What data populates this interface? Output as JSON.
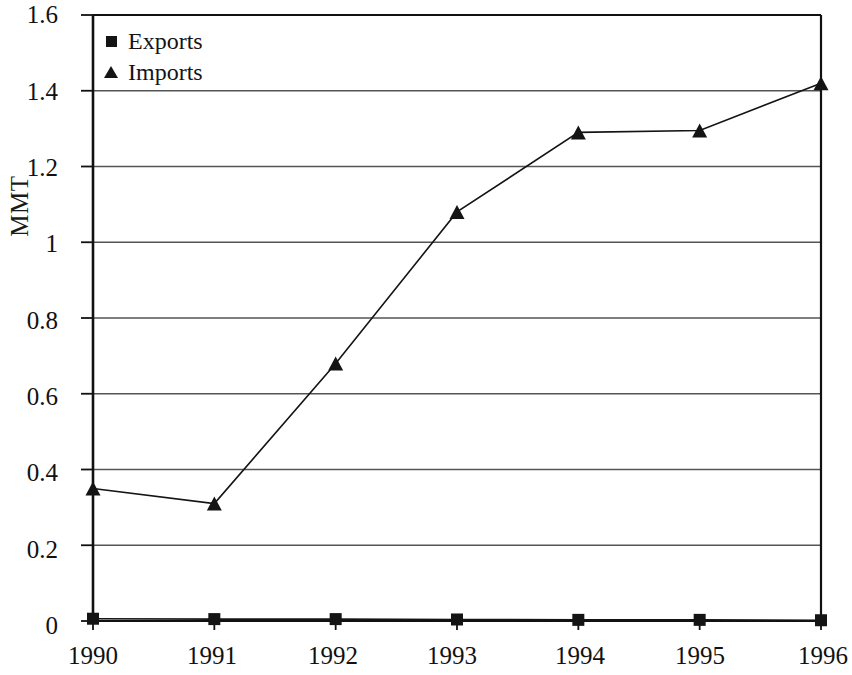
{
  "chart_data": {
    "type": "line",
    "title": "",
    "xlabel": "",
    "ylabel": "MMT",
    "categories": [
      "1990",
      "1991",
      "1992",
      "1993",
      "1994",
      "1995",
      "1996"
    ],
    "series": [
      {
        "name": "Exports",
        "marker": "square",
        "values": [
          0.006,
          0.005,
          0.005,
          0.004,
          0.003,
          0.003,
          0.002
        ]
      },
      {
        "name": "Imports",
        "marker": "triangle",
        "values": [
          0.35,
          0.31,
          0.68,
          1.08,
          1.29,
          1.295,
          1.42
        ]
      }
    ],
    "ylim": [
      0,
      1.6
    ],
    "y_ticks": [
      "0",
      "0.2",
      "0.4",
      "0.6",
      "0.8",
      "1",
      "1.2",
      "1.4",
      "1.6"
    ],
    "y_tick_values": [
      0,
      0.2,
      0.4,
      0.6,
      0.8,
      1,
      1.2,
      1.4,
      1.6
    ],
    "grid": true,
    "grid_axis": "y",
    "legend_position": "top-left",
    "line_color": "#141414",
    "grid_color": "#555555",
    "axis_color": "#111111",
    "plot_background": "#ffffff"
  },
  "legend": {
    "items": [
      {
        "label": "Exports",
        "marker": "square-marker-icon"
      },
      {
        "label": "Imports",
        "marker": "triangle-marker-icon"
      }
    ]
  },
  "axes": {
    "y_title": "MMT",
    "y_labels": [
      "1.6",
      "1.4",
      "1.2",
      "1",
      "0.8",
      "0.6",
      "0.4",
      "0.2",
      "0"
    ],
    "x_labels": [
      "1990",
      "1991",
      "1992",
      "1993",
      "1994",
      "1995",
      "1996"
    ]
  }
}
